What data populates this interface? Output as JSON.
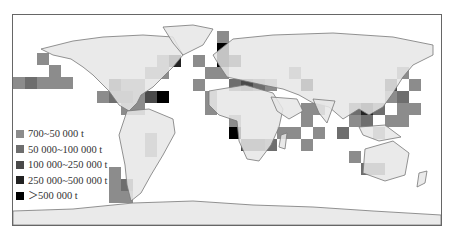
{
  "map": {
    "title": "",
    "land_color": "#e6e6e6",
    "coast_color": "#777777",
    "ocean_color": "#ffffff"
  },
  "legend": {
    "items": [
      {
        "label": "700~50 000 t",
        "color": "#8c8c8c"
      },
      {
        "label": "50 000~100 000 t",
        "color": "#6e6e6e"
      },
      {
        "label": "100 000~250 000 t",
        "color": "#4a4a4a"
      },
      {
        "label": "250 000~500 000 t",
        "color": "#222222"
      },
      {
        "label": "＞500 000 t",
        "color": "#000000"
      }
    ]
  },
  "cells": [
    {
      "x": 12,
      "y": 76,
      "c": 0
    },
    {
      "x": 24,
      "y": 76,
      "c": 1
    },
    {
      "x": 36,
      "y": 76,
      "c": 0
    },
    {
      "x": 48,
      "y": 76,
      "c": 0
    },
    {
      "x": 48,
      "y": 64,
      "c": 0
    },
    {
      "x": 36,
      "y": 52,
      "c": 0
    },
    {
      "x": 60,
      "y": 76,
      "c": 0
    },
    {
      "x": 96,
      "y": 90,
      "c": 0
    },
    {
      "x": 108,
      "y": 90,
      "c": 1
    },
    {
      "x": 120,
      "y": 90,
      "c": 1
    },
    {
      "x": 108,
      "y": 78,
      "c": 1
    },
    {
      "x": 120,
      "y": 78,
      "c": 0
    },
    {
      "x": 132,
      "y": 78,
      "c": 0
    },
    {
      "x": 132,
      "y": 90,
      "c": 0
    },
    {
      "x": 144,
      "y": 90,
      "c": 2
    },
    {
      "x": 156,
      "y": 90,
      "c": 4
    },
    {
      "x": 108,
      "y": 78,
      "c": 2
    },
    {
      "x": 144,
      "y": 66,
      "c": 0
    },
    {
      "x": 156,
      "y": 66,
      "c": 0
    },
    {
      "x": 156,
      "y": 54,
      "c": 0
    },
    {
      "x": 168,
      "y": 54,
      "c": 3
    },
    {
      "x": 192,
      "y": 54,
      "c": 0
    },
    {
      "x": 120,
      "y": 102,
      "c": 0
    },
    {
      "x": 132,
      "y": 102,
      "c": 0
    },
    {
      "x": 108,
      "y": 166,
      "c": 0
    },
    {
      "x": 108,
      "y": 178,
      "c": 0
    },
    {
      "x": 108,
      "y": 190,
      "c": 0
    },
    {
      "x": 120,
      "y": 178,
      "c": 1
    },
    {
      "x": 120,
      "y": 190,
      "c": 0
    },
    {
      "x": 144,
      "y": 132,
      "c": 0
    },
    {
      "x": 144,
      "y": 144,
      "c": 0
    },
    {
      "x": 216,
      "y": 30,
      "c": 0
    },
    {
      "x": 216,
      "y": 42,
      "c": 4
    },
    {
      "x": 216,
      "y": 54,
      "c": 4
    },
    {
      "x": 228,
      "y": 54,
      "c": 2
    },
    {
      "x": 204,
      "y": 66,
      "c": 0
    },
    {
      "x": 216,
      "y": 66,
      "c": 0
    },
    {
      "x": 192,
      "y": 78,
      "c": 0
    },
    {
      "x": 204,
      "y": 90,
      "c": 0
    },
    {
      "x": 204,
      "y": 102,
      "c": 0
    },
    {
      "x": 228,
      "y": 114,
      "c": 0
    },
    {
      "x": 228,
      "y": 126,
      "c": 4
    },
    {
      "x": 240,
      "y": 138,
      "c": 2
    },
    {
      "x": 252,
      "y": 138,
      "c": 2
    },
    {
      "x": 264,
      "y": 138,
      "c": 1
    },
    {
      "x": 276,
      "y": 126,
      "c": 0
    },
    {
      "x": 228,
      "y": 78,
      "c": 1
    },
    {
      "x": 240,
      "y": 78,
      "c": 2
    },
    {
      "x": 252,
      "y": 78,
      "c": 1
    },
    {
      "x": 264,
      "y": 78,
      "c": 0
    },
    {
      "x": 288,
      "y": 66,
      "c": 0
    },
    {
      "x": 300,
      "y": 78,
      "c": 3
    },
    {
      "x": 300,
      "y": 102,
      "c": 0
    },
    {
      "x": 312,
      "y": 102,
      "c": 0
    },
    {
      "x": 300,
      "y": 114,
      "c": 0
    },
    {
      "x": 312,
      "y": 126,
      "c": 0
    },
    {
      "x": 288,
      "y": 126,
      "c": 0
    },
    {
      "x": 300,
      "y": 138,
      "c": 0
    },
    {
      "x": 348,
      "y": 102,
      "c": 1
    },
    {
      "x": 360,
      "y": 102,
      "c": 3
    },
    {
      "x": 372,
      "y": 102,
      "c": 1
    },
    {
      "x": 348,
      "y": 114,
      "c": 0
    },
    {
      "x": 360,
      "y": 114,
      "c": 1
    },
    {
      "x": 384,
      "y": 90,
      "c": 0
    },
    {
      "x": 396,
      "y": 90,
      "c": 1
    },
    {
      "x": 384,
      "y": 78,
      "c": 2
    },
    {
      "x": 396,
      "y": 66,
      "c": 0
    },
    {
      "x": 408,
      "y": 78,
      "c": 0
    },
    {
      "x": 396,
      "y": 102,
      "c": 0
    },
    {
      "x": 408,
      "y": 102,
      "c": 0
    },
    {
      "x": 384,
      "y": 114,
      "c": 0
    },
    {
      "x": 396,
      "y": 114,
      "c": 0
    },
    {
      "x": 372,
      "y": 126,
      "c": 0
    },
    {
      "x": 336,
      "y": 126,
      "c": 1
    },
    {
      "x": 348,
      "y": 150,
      "c": 0
    },
    {
      "x": 360,
      "y": 162,
      "c": 1
    },
    {
      "x": 372,
      "y": 162,
      "c": 1
    }
  ]
}
